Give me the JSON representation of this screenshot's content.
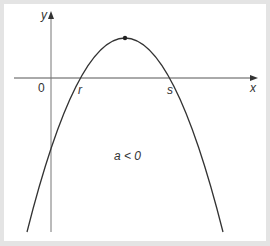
{
  "diagram": {
    "axes": {
      "x_label": "x",
      "y_label": "y",
      "origin_label": "0"
    },
    "roots": [
      {
        "label": "r"
      },
      {
        "label": "s"
      }
    ],
    "condition_label": "a < 0",
    "vertex_marker": "dot",
    "colors": {
      "background": "#e4e4e4",
      "panel": "#ffffff",
      "curve": "#333333",
      "axis": "#555555"
    }
  }
}
